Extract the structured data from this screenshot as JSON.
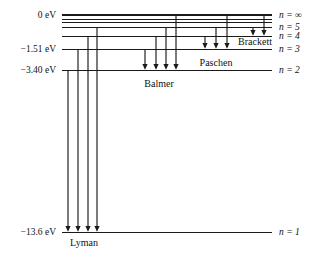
{
  "figure": {
    "background_color": "#ffffff",
    "line_color": "#1a1a1a"
  },
  "chart_data": {
    "type": "diagram",
    "xlabel": "",
    "ylabel": "Energy (eV)",
    "levels": [
      {
        "n": "1",
        "energy_eV": -13.6,
        "energy_label": "-13.6 eV",
        "n_label": "n = 1",
        "y": 232
      },
      {
        "n": "2",
        "energy_eV": -3.4,
        "energy_label": "-3.40 eV",
        "n_label": "n = 2",
        "y": 70
      },
      {
        "n": "3",
        "energy_eV": -1.51,
        "energy_label": "-1.51 eV",
        "n_label": "n = 3",
        "y": 49
      },
      {
        "n": "4",
        "energy_eV": -0.85,
        "energy_label": "",
        "n_label": "n = 4",
        "y": 36
      },
      {
        "n": "5",
        "energy_eV": -0.54,
        "energy_label": "",
        "n_label": "n = 5",
        "y": 27
      },
      {
        "n": "inf",
        "energy_eV": 0.0,
        "energy_label": "0 eV",
        "n_label": "n = ∞",
        "y": 15
      }
    ],
    "converging_levels_y": [
      19,
      22
    ],
    "series": [
      {
        "name": "Lyman",
        "label": "Lyman",
        "final_level": "1",
        "transitions": [
          {
            "from": "2",
            "to": "1",
            "x": 68
          },
          {
            "from": "3",
            "to": "1",
            "x": 78
          },
          {
            "from": "4",
            "to": "1",
            "x": 88
          },
          {
            "from": "5",
            "to": "1",
            "x": 97
          }
        ]
      },
      {
        "name": "Balmer",
        "label": "Balmer",
        "final_level": "2",
        "transitions": [
          {
            "from": "3",
            "to": "2",
            "x": 145
          },
          {
            "from": "4",
            "to": "2",
            "x": 156
          },
          {
            "from": "5",
            "to": "2",
            "x": 166
          },
          {
            "from": "inf",
            "to": "2",
            "x": 176
          }
        ]
      },
      {
        "name": "Paschen",
        "label": "Paschen",
        "final_level": "3",
        "transitions": [
          {
            "from": "4",
            "to": "3",
            "x": 205
          },
          {
            "from": "5",
            "to": "3",
            "x": 216
          },
          {
            "from": "inf",
            "to": "3",
            "x": 227
          }
        ]
      },
      {
        "name": "Brackett",
        "label": "Brackett",
        "final_level": "4",
        "transitions": [
          {
            "from": "5",
            "to": "4",
            "x": 253
          },
          {
            "from": "inf",
            "to": "4",
            "x": 264
          }
        ]
      }
    ],
    "series_label_positions": [
      {
        "name": "Lyman",
        "x": 84,
        "y": 246
      },
      {
        "name": "Balmer",
        "x": 159,
        "y": 87
      },
      {
        "name": "Paschen",
        "x": 216,
        "y": 66
      },
      {
        "name": "Brackett",
        "x": 255,
        "y": 45
      }
    ],
    "axis_extent": {
      "left": 62,
      "right": 272
    },
    "grid": false,
    "legend": "none"
  }
}
